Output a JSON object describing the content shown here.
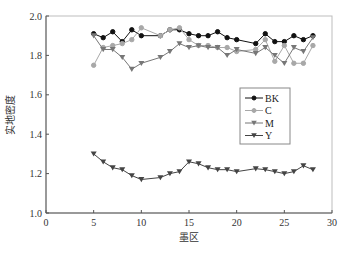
{
  "chart_data": {
    "type": "line",
    "title": "",
    "xlabel": "墨区",
    "ylabel": "实地密度",
    "xlim": [
      0,
      30
    ],
    "ylim": [
      1.0,
      2.0
    ],
    "xticks": [
      0,
      5,
      10,
      15,
      20,
      25,
      30
    ],
    "yticks": [
      "1.0",
      "1.2",
      "1.4",
      "1.6",
      "1.8",
      "2.0"
    ],
    "grid": false,
    "legend_position": "right-middle inside",
    "x": [
      5,
      6,
      7,
      8,
      9,
      10,
      12,
      13,
      14,
      15,
      16,
      17,
      18,
      19,
      20,
      22,
      23,
      24,
      25,
      26,
      27,
      28
    ],
    "series": [
      {
        "name": "BK",
        "marker": "circle",
        "color": "#111111",
        "values": [
          1.91,
          1.89,
          1.92,
          1.87,
          1.93,
          1.9,
          1.9,
          1.93,
          1.93,
          1.91,
          1.9,
          1.9,
          1.92,
          1.89,
          1.88,
          1.86,
          1.91,
          1.87,
          1.87,
          1.9,
          1.88,
          1.9
        ]
      },
      {
        "name": "C",
        "marker": "circle",
        "color": "#a8a8a8",
        "values": [
          1.75,
          1.84,
          1.85,
          1.86,
          1.88,
          1.94,
          1.9,
          1.93,
          1.94,
          1.88,
          1.85,
          1.85,
          1.84,
          1.84,
          1.82,
          1.83,
          1.88,
          1.77,
          1.85,
          1.76,
          1.76,
          1.85
        ]
      },
      {
        "name": "M",
        "marker": "triangle-down",
        "color": "#777777",
        "values": [
          1.9,
          1.83,
          1.83,
          1.79,
          1.73,
          1.76,
          1.79,
          1.82,
          1.86,
          1.84,
          1.85,
          1.84,
          1.84,
          1.8,
          1.83,
          1.81,
          1.84,
          1.8,
          1.76,
          1.84,
          1.82,
          1.89
        ]
      },
      {
        "name": "Y",
        "marker": "triangle-down",
        "color": "#444444",
        "values": [
          1.3,
          1.26,
          1.23,
          1.22,
          1.19,
          1.17,
          1.18,
          1.2,
          1.21,
          1.26,
          1.25,
          1.23,
          1.22,
          1.22,
          1.21,
          1.225,
          1.22,
          1.21,
          1.2,
          1.21,
          1.24,
          1.22
        ]
      }
    ]
  }
}
